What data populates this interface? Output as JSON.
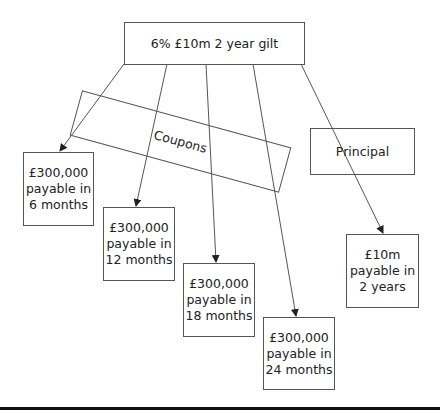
{
  "diagram": {
    "root": {
      "label": "6% £10m 2 year gilt"
    },
    "groups": [
      {
        "label": "Coupons"
      },
      {
        "label": "Principal"
      }
    ],
    "cashflows": [
      {
        "amount": "£300,000",
        "line2": "payable in",
        "when": "6 months"
      },
      {
        "amount": "£300,000",
        "line2": "payable in",
        "when": "12 months"
      },
      {
        "amount": "£300,000",
        "line2": "payable in",
        "when": "18 months"
      },
      {
        "amount": "£300,000",
        "line2": "payable in",
        "when": "24 months"
      },
      {
        "amount": "£10m",
        "line2": "payable in",
        "when": "2 years"
      }
    ],
    "colors": {
      "line": "#555555",
      "text": "#222222",
      "bar": "#111111"
    }
  }
}
